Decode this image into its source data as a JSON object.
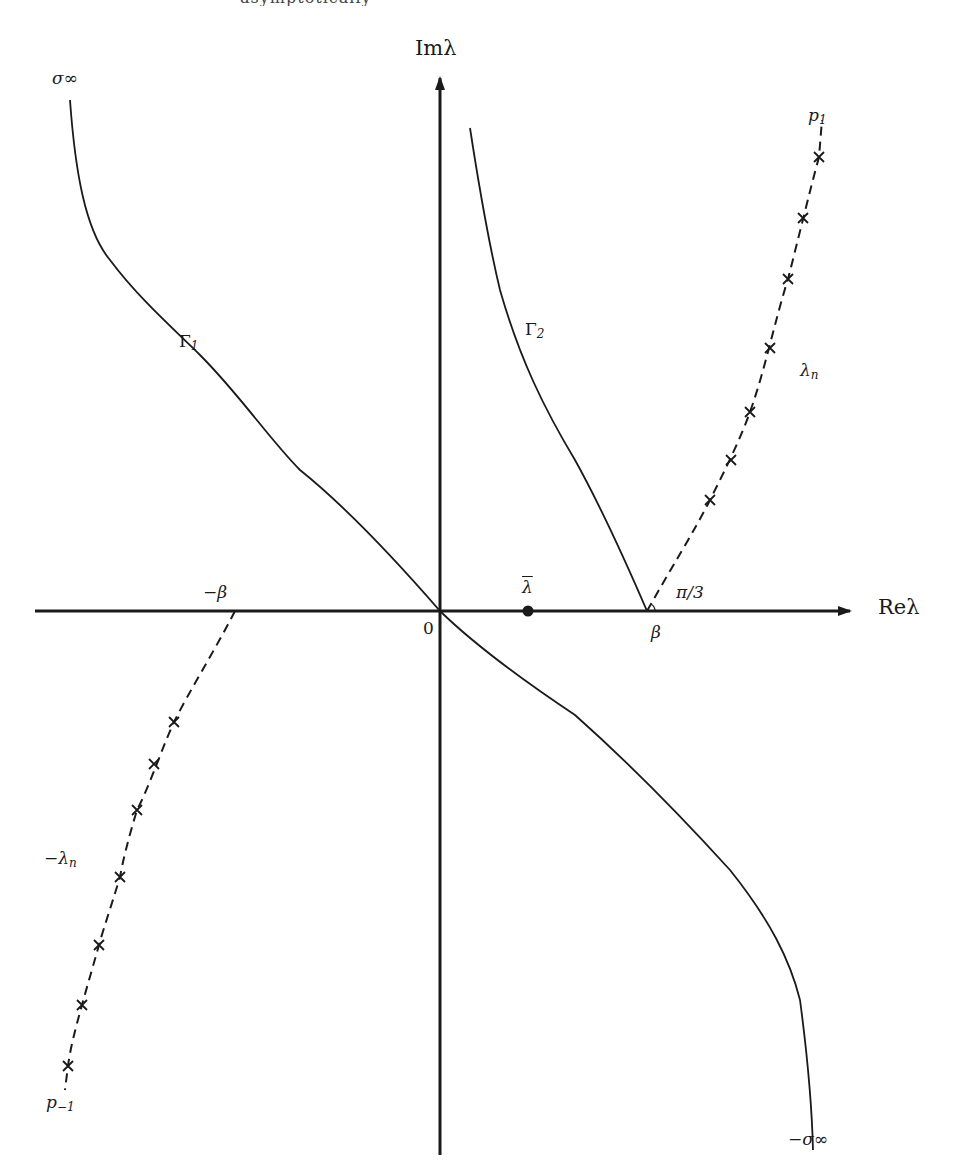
{
  "header": {
    "cut_off_text": "asymptotically"
  },
  "axes": {
    "x_label": "Reλ",
    "y_label": "Imλ",
    "origin_label": "0",
    "origin_px": [
      440,
      611
    ],
    "x_axis_px": [
      35,
      850
    ],
    "y_axis_px": [
      1155,
      75
    ],
    "stroke_color": "#1a1a1a"
  },
  "labels": {
    "sigma_inf": "σ∞",
    "neg_sigma_inf": "−σ∞",
    "gamma1": "Γ",
    "gamma1_sub": "1",
    "gamma2": "Γ",
    "gamma2_sub": "2",
    "lambda_n": "λ",
    "lambda_n_sub": "n",
    "neg_lambda_n": "−λ",
    "neg_lambda_n_sub": "n",
    "p1": "p",
    "p1_sub": "1",
    "p_neg1": "p",
    "p_neg1_sub": "−1",
    "beta": "β",
    "neg_beta": "−β",
    "angle": "π/3",
    "lambda_bar": "λ"
  },
  "points": {
    "lambda_bar_px": [
      528,
      611
    ],
    "beta_px": [
      647,
      611
    ],
    "neg_beta_px": [
      235,
      611
    ]
  },
  "curves": {
    "gamma1_upper": "M70,100 C75,170 85,230 110,260 C140,300 175,330 200,355 C240,395 270,440 300,470 C350,510 400,565 440,611",
    "gamma1_lower": "M440,611 C480,650 530,685 575,715 C620,755 680,815 730,870 C770,920 790,960 800,1000 C808,1060 812,1110 813,1150",
    "gamma2": "M470,128 C478,180 488,240 500,290 C520,360 545,410 575,460 C600,505 625,560 647,611",
    "lambda_n_path": "M647,611 C670,570 695,530 710,500 C725,470 740,440 750,412 C765,370 775,320 788,279 C798,240 810,190 819,157 L822,120",
    "neg_lambda_n_path": "M235,611 C215,650 190,690 174,722 C162,748 150,785 137,810 C128,840 123,860 120,877 C110,910 103,930 99,945 C92,970 86,990 82,1005 C75,1030 70,1050 68,1066 L65,1090"
  },
  "crosses_right": [
    [
      819,
      157
    ],
    [
      803,
      218
    ],
    [
      788,
      279
    ],
    [
      770,
      348
    ],
    [
      750,
      412
    ],
    [
      731,
      460
    ],
    [
      710,
      500
    ]
  ],
  "crosses_left": [
    [
      174,
      722
    ],
    [
      154,
      764
    ],
    [
      137,
      810
    ],
    [
      120,
      877
    ],
    [
      99,
      945
    ],
    [
      82,
      1005
    ],
    [
      68,
      1066
    ]
  ]
}
